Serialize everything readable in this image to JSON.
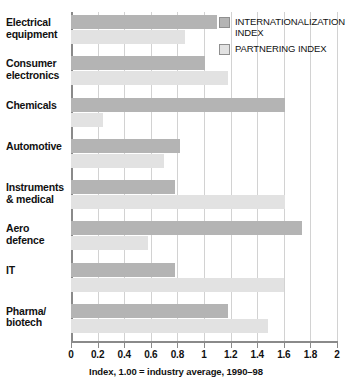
{
  "chart_data": {
    "type": "bar",
    "orientation": "horizontal",
    "title": "",
    "xlabel": "Index, 1.00 = industry average, 1990–98",
    "ylabel": "",
    "xlim": [
      0,
      2
    ],
    "xticks": [
      "0",
      "0.2",
      "0.4",
      "0.6",
      "0.8",
      "1",
      "1.2",
      "1.4",
      "1.6",
      "1.8",
      "2"
    ],
    "xtick_values": [
      0,
      0.2,
      0.4,
      0.6,
      0.8,
      1.0,
      1.2,
      1.4,
      1.6,
      1.8,
      2.0
    ],
    "grid": true,
    "legend_position": "top-right",
    "categories": [
      "Electrical equipment",
      "Consumer electronics",
      "Chemicals",
      "Automotive",
      "Instruments & medical",
      "Aero defence",
      "IT",
      "Pharma/ biotech"
    ],
    "series": [
      {
        "name": "INTERNATIONALIZATION INDEX",
        "color": "#b4b4b4",
        "values": [
          1.1,
          1.01,
          1.61,
          0.82,
          0.78,
          1.74,
          0.78,
          1.18
        ]
      },
      {
        "name": "PARTNERING INDEX",
        "color": "#e2e2e2",
        "values": [
          0.86,
          1.18,
          0.24,
          0.7,
          1.61,
          0.58,
          1.6,
          1.48
        ]
      }
    ]
  },
  "categories_display": [
    {
      "line1": "Electrical",
      "line2": "equipment"
    },
    {
      "line1": "Consumer",
      "line2": "electronics"
    },
    {
      "line1": "Chemicals",
      "line2": ""
    },
    {
      "line1": "Automotive",
      "line2": ""
    },
    {
      "line1": "Instruments",
      "line2": "& medical"
    },
    {
      "line1": "Aero",
      "line2": "defence"
    },
    {
      "line1": "IT",
      "line2": ""
    },
    {
      "line1": "Pharma/",
      "line2": "biotech"
    }
  ],
  "legend": {
    "items": [
      {
        "label_line1": "INTERNATIONALIZATION",
        "label_line2": "INDEX",
        "color": "#b4b4b4"
      },
      {
        "label_line1": "PARTNERING INDEX",
        "label_line2": "",
        "color": "#e2e2e2"
      }
    ]
  },
  "axis": {
    "caption": "Index, 1.00 = industry average, 1990–98"
  }
}
